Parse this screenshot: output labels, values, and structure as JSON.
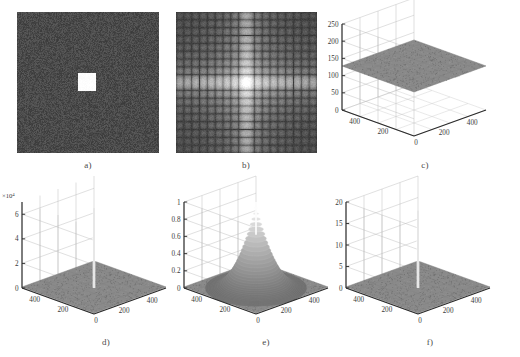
{
  "figure": {
    "title": "",
    "background": "#ffffff",
    "panel_captions": [
      "a)",
      "b)",
      "c)",
      "d)",
      "e)",
      "f)"
    ]
  },
  "chart_data": [
    {
      "id": "a",
      "type": "heatmap",
      "caption": "a)",
      "title": "",
      "xlabel": "",
      "ylabel": "",
      "description": "Noisy dark gray field with a bright white square block near the centre",
      "colors": {
        "background_mean": "#4a4a4a",
        "block": "#fdfdfd"
      },
      "noise_amplitude": 16,
      "block": {
        "x_frac": 0.43,
        "y_frac": 0.43,
        "w_frac": 0.125,
        "h_frac": 0.125
      },
      "grid": false,
      "axis_visible": false
    },
    {
      "id": "b",
      "type": "heatmap",
      "caption": "b)",
      "title": "",
      "xlabel": "",
      "ylabel": "",
      "description": "2D magnitude spectrum (log) of a rect function: bright horizontal and vertical cross with sinc side lobes",
      "colors": {
        "background_mean": "#4f4f4f",
        "peak": "#ffffff"
      },
      "grid": false,
      "axis_visible": false
    },
    {
      "id": "c",
      "type": "surface",
      "caption": "c)",
      "title": "",
      "xlabel": "",
      "ylabel": "",
      "zlabel": "",
      "description": "Flat noisy gray surface plateau hovering at about 128",
      "zticks": [
        0,
        50,
        100,
        150,
        200,
        250
      ],
      "zlim": [
        0,
        250
      ],
      "xticks": [
        0,
        200,
        400
      ],
      "yticks": [
        0,
        200,
        400
      ],
      "xlim": [
        0,
        512
      ],
      "ylim": [
        0,
        512
      ],
      "surface_level": 128,
      "exponent_label": "",
      "grid": true
    },
    {
      "id": "d",
      "type": "surface",
      "caption": "d)",
      "title": "",
      "xlabel": "",
      "ylabel": "",
      "zlabel": "",
      "description": "Flat noise floor with one tall narrow central spike reaching about 6.5e4",
      "zticks": [
        0,
        2,
        4,
        6
      ],
      "zlim": [
        0,
        7
      ],
      "exponent_label": "×10",
      "exponent_power": "4",
      "xticks": [
        0,
        200,
        400
      ],
      "yticks": [
        0,
        200,
        400
      ],
      "xlim": [
        0,
        512
      ],
      "ylim": [
        0,
        512
      ],
      "spike_height": 6.5,
      "grid": true
    },
    {
      "id": "e",
      "type": "surface",
      "caption": "e)",
      "title": "",
      "xlabel": "",
      "ylabel": "",
      "zlabel": "",
      "description": "Normalized surface with a sharp cone-shaped peak at the centre rising to 1",
      "zticks": [
        0,
        0.2,
        0.4,
        0.6,
        0.8,
        1
      ],
      "ztick_labels": [
        "0",
        "0.2",
        "0.4",
        "0.6",
        "0.8",
        "1"
      ],
      "zlim": [
        0,
        1
      ],
      "xticks": [
        0,
        200,
        400
      ],
      "yticks": [
        0,
        200,
        400
      ],
      "xlim": [
        0,
        512
      ],
      "ylim": [
        0,
        512
      ],
      "peak_height": 1,
      "exponent_label": "",
      "grid": true
    },
    {
      "id": "f",
      "type": "surface",
      "caption": "f)",
      "title": "",
      "xlabel": "",
      "ylabel": "",
      "zlabel": "",
      "description": "Flat noise floor with one tall narrow central spike reaching about 18",
      "zticks": [
        0,
        5,
        10,
        15,
        20
      ],
      "zlim": [
        0,
        20
      ],
      "xticks": [
        0,
        200,
        400
      ],
      "yticks": [
        0,
        200,
        400
      ],
      "xlim": [
        0,
        512
      ],
      "ylim": [
        0,
        512
      ],
      "spike_height": 18,
      "exponent_label": "",
      "grid": true
    }
  ]
}
